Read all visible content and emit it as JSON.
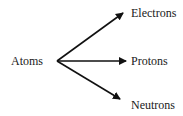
{
  "diagram": {
    "root": {
      "label": "Atoms"
    },
    "children": [
      {
        "label": "Electrons"
      },
      {
        "label": "Protons"
      },
      {
        "label": "Neutrons"
      }
    ],
    "colors": {
      "line": "#111111",
      "text": "#1a1a1a",
      "background": "#ffffff"
    }
  }
}
